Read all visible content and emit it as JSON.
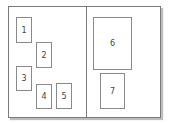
{
  "diagram": {
    "boxes": [
      {
        "label": "1"
      },
      {
        "label": "2"
      },
      {
        "label": "3"
      },
      {
        "label": "4"
      },
      {
        "label": "5"
      },
      {
        "label": "6"
      },
      {
        "label": "7"
      }
    ],
    "colors": {
      "border": "#7a7a7a",
      "shadow": "#bdbdbd",
      "background": "#ffffff"
    }
  }
}
